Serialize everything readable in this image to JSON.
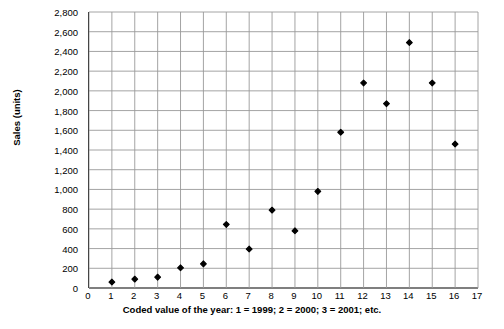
{
  "chart_data": {
    "type": "scatter",
    "title": "",
    "xlabel": "Coded value of the year: 1 = 1999; 2 = 2000;  3 = 2001; etc.",
    "ylabel": "Sales (units)",
    "xlim": [
      0,
      17
    ],
    "ylim": [
      0,
      2800
    ],
    "grid": true,
    "legend": "none",
    "x_tick_labels": [
      "0",
      "1",
      "2",
      "3",
      "4",
      "5",
      "6",
      "7",
      "8",
      "9",
      "10",
      "11",
      "12",
      "13",
      "14",
      "15",
      "16",
      "17"
    ],
    "x_tick_values": [
      0,
      1,
      2,
      3,
      4,
      5,
      6,
      7,
      8,
      9,
      10,
      11,
      12,
      13,
      14,
      15,
      16,
      17
    ],
    "y_tick_labels": [
      "0",
      "200",
      "400",
      "600",
      "800",
      "1,000",
      "1,200",
      "1,400",
      "1,600",
      "1,800",
      "2,000",
      "2,200",
      "2,400",
      "2,600",
      "2,800"
    ],
    "y_tick_values": [
      0,
      200,
      400,
      600,
      800,
      1000,
      1200,
      1400,
      1600,
      1800,
      2000,
      2200,
      2400,
      2600,
      2800
    ],
    "x": [
      1,
      2,
      3,
      4,
      5,
      6,
      7,
      8,
      9,
      10,
      11,
      12,
      13,
      14,
      15,
      16
    ],
    "values": [
      60,
      90,
      110,
      205,
      245,
      645,
      395,
      790,
      580,
      980,
      1580,
      2080,
      1870,
      2490,
      2080,
      1460
    ],
    "series": [
      {
        "name": "Sales",
        "marker": "diamond",
        "color": "#000000",
        "points": [
          {
            "x": 1,
            "y": 60
          },
          {
            "x": 2,
            "y": 90
          },
          {
            "x": 3,
            "y": 110
          },
          {
            "x": 4,
            "y": 205
          },
          {
            "x": 5,
            "y": 245
          },
          {
            "x": 6,
            "y": 645
          },
          {
            "x": 7,
            "y": 395
          },
          {
            "x": 8,
            "y": 790
          },
          {
            "x": 9,
            "y": 580
          },
          {
            "x": 10,
            "y": 980
          },
          {
            "x": 11,
            "y": 1580
          },
          {
            "x": 12,
            "y": 2080
          },
          {
            "x": 13,
            "y": 1870
          },
          {
            "x": 14,
            "y": 2490
          },
          {
            "x": 15,
            "y": 2080
          },
          {
            "x": 16,
            "y": 1460
          }
        ]
      }
    ],
    "colors": {
      "marker": "#000000",
      "grid": "#9a9a9a",
      "axis": "#000000",
      "background": "#ffffff"
    }
  }
}
